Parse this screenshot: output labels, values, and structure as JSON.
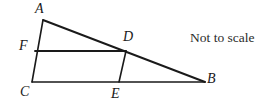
{
  "figure": {
    "name": "triangle-with-inscribed-quadrilateral",
    "background_color": "#ffffff",
    "stroke_color": "#1a1a1a",
    "note": "Not to scale",
    "labels": {
      "A": "A",
      "B": "B",
      "C": "C",
      "D": "D",
      "E": "E",
      "F": "F"
    },
    "points": {
      "A": {
        "x": 43,
        "y": 20
      },
      "B": {
        "x": 205,
        "y": 82
      },
      "C": {
        "x": 32,
        "y": 82
      },
      "D": {
        "x": 126,
        "y": 51
      },
      "E": {
        "x": 119,
        "y": 82
      },
      "F": {
        "x": 35,
        "y": 51
      }
    },
    "segments": [
      {
        "name": "segment-AC",
        "from": "A",
        "to": "C",
        "width": 1.6
      },
      {
        "name": "segment-AB",
        "from": "A",
        "to": "B",
        "width": 1.9
      },
      {
        "name": "segment-CB",
        "from": "C",
        "to": "B",
        "width": 1.6
      },
      {
        "name": "segment-FD",
        "from": "F",
        "to": "D",
        "width": 1.9
      },
      {
        "name": "segment-DE",
        "from": "D",
        "to": "E",
        "width": 1.6
      }
    ]
  }
}
